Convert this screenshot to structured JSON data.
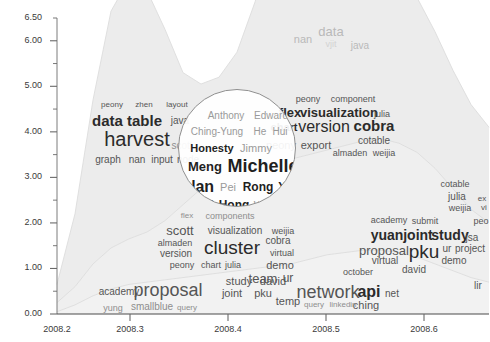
{
  "chart_data": {
    "type": "area",
    "title": "",
    "xlabel": "",
    "ylabel": "",
    "xlim": [
      2008.2,
      2008.65
    ],
    "ylim": [
      0.0,
      6.5
    ],
    "grid": false,
    "legend": "none",
    "x_ticks": [
      "2008.2",
      "2008.3",
      "2008.4",
      "2008.5",
      "2008.6"
    ],
    "y_ticks": [
      "0.00",
      "1.00",
      "2.00",
      "3.00",
      "4.00",
      "5.00",
      "6.00",
      "6.50"
    ],
    "y_minor_step": 0.5,
    "series": [
      {
        "name": "topic-upper-stream",
        "color": "#ececec",
        "values": [
          0.4,
          1.6,
          3.6,
          5.2,
          5.7,
          5.3,
          4.2,
          2.9,
          2.3,
          2.2,
          2.6,
          3.6,
          4.8,
          5.8,
          6.15,
          5.9,
          5.2,
          4.5,
          4.0,
          3.7,
          3.4,
          3.0,
          2.6,
          2.3,
          2.1
        ]
      },
      {
        "name": "topic-middle-stream",
        "color": "#efefef",
        "values": [
          0.2,
          0.4,
          0.7,
          0.9,
          1.0,
          1.1,
          1.3,
          1.6,
          1.9,
          2.1,
          2.2,
          2.25,
          2.3,
          2.3,
          2.3,
          2.3,
          2.35,
          2.4,
          2.45,
          2.4,
          2.3,
          2.1,
          1.8,
          1.5,
          1.3
        ]
      },
      {
        "name": "topic-lower-stream",
        "color": "#f2f2f2",
        "values": [
          0.05,
          0.2,
          0.4,
          0.55,
          0.65,
          0.7,
          0.75,
          0.8,
          0.85,
          0.9,
          0.95,
          1.0,
          1.05,
          1.1,
          1.2,
          1.3,
          1.35,
          1.4,
          1.4,
          1.35,
          1.25,
          1.1,
          0.95,
          0.8,
          0.7
        ]
      }
    ]
  },
  "axis": {
    "y_labels": [
      "6.50",
      "6.00",
      "5.00",
      "4.00",
      "3.00",
      "2.00",
      "1.00",
      "0.00"
    ],
    "x_labels": [
      "2008.2",
      "2008.3",
      "2008.4",
      "2008.5",
      "2008.6"
    ]
  },
  "cloud": {
    "left_peak": [
      {
        "t": "peony",
        "x": 112,
        "y": 105,
        "s": 8,
        "c": "g4",
        "b": false
      },
      {
        "t": "zhen",
        "x": 144,
        "y": 105,
        "s": 8,
        "c": "g4",
        "b": false
      },
      {
        "t": "layout",
        "x": 177,
        "y": 105,
        "s": 8,
        "c": "g4",
        "b": false
      },
      {
        "t": "data table",
        "x": 127,
        "y": 120,
        "s": 15,
        "c": "",
        "b": true
      },
      {
        "t": "java",
        "x": 180,
        "y": 121,
        "s": 10,
        "c": "g4",
        "b": false
      },
      {
        "t": "harvest",
        "x": 137,
        "y": 139,
        "s": 20,
        "c": "",
        "b": false
      },
      {
        "t": "scott",
        "x": 182,
        "y": 146,
        "s": 10,
        "c": "g1",
        "b": false
      },
      {
        "t": "graph",
        "x": 108,
        "y": 160,
        "s": 10,
        "c": "g4",
        "b": false
      },
      {
        "t": "nan",
        "x": 137,
        "y": 160,
        "s": 10,
        "c": "g4",
        "b": false
      },
      {
        "t": "input",
        "x": 162,
        "y": 160,
        "s": 10,
        "c": "g4",
        "b": false
      },
      {
        "t": "node",
        "x": 188,
        "y": 160,
        "s": 10,
        "c": "g4",
        "b": false
      }
    ],
    "right_peak_top": [
      {
        "t": "nan",
        "x": 303,
        "y": 39,
        "s": 11,
        "c": "g2",
        "b": false
      },
      {
        "t": "data",
        "x": 331,
        "y": 31,
        "s": 13,
        "c": "g2",
        "b": false
      },
      {
        "t": "vjit",
        "x": 331,
        "y": 44,
        "s": 9,
        "c": "g3",
        "b": false
      },
      {
        "t": "java",
        "x": 360,
        "y": 46,
        "s": 10,
        "c": "g2",
        "b": false
      }
    ],
    "right_peak": [
      {
        "t": "peony",
        "x": 308,
        "y": 99,
        "s": 9,
        "c": "g4",
        "b": false
      },
      {
        "t": "component",
        "x": 353,
        "y": 99,
        "s": 9,
        "c": "g4",
        "b": false
      },
      {
        "t": "flex",
        "x": 290,
        "y": 112,
        "s": 13,
        "c": "",
        "b": true
      },
      {
        "t": "visualization",
        "x": 339,
        "y": 112,
        "s": 13,
        "c": "",
        "b": true
      },
      {
        "t": "julia",
        "x": 382,
        "y": 114,
        "s": 9,
        "c": "g4",
        "b": false
      },
      {
        "t": "chart",
        "x": 284,
        "y": 127,
        "s": 11,
        "c": "",
        "b": true
      },
      {
        "t": "version",
        "x": 324,
        "y": 127,
        "s": 16,
        "c": "",
        "b": false
      },
      {
        "t": "cobra",
        "x": 374,
        "y": 125,
        "s": 15,
        "c": "",
        "b": true
      },
      {
        "t": "cotable",
        "x": 374,
        "y": 141,
        "s": 10,
        "c": "g4",
        "b": false
      },
      {
        "t": "peony",
        "x": 281,
        "y": 145,
        "s": 11,
        "c": "g4",
        "b": false
      },
      {
        "t": "export",
        "x": 316,
        "y": 145,
        "s": 11,
        "c": "g4",
        "b": false
      },
      {
        "t": "almaden",
        "x": 350,
        "y": 153,
        "s": 9,
        "c": "g4",
        "b": false
      },
      {
        "t": "weijia",
        "x": 384,
        "y": 153,
        "s": 9,
        "c": "g4",
        "b": false
      }
    ],
    "middle_band": [
      {
        "t": "flex",
        "x": 187,
        "y": 216,
        "s": 8,
        "c": "g1",
        "b": false
      },
      {
        "t": "components",
        "x": 230,
        "y": 216,
        "s": 9,
        "c": "g1",
        "b": false
      },
      {
        "t": "scott",
        "x": 180,
        "y": 230,
        "s": 13,
        "c": "g4",
        "b": false
      },
      {
        "t": "visualization",
        "x": 235,
        "y": 231,
        "s": 10,
        "c": "g4",
        "b": false
      },
      {
        "t": "weijia",
        "x": 283,
        "y": 231,
        "s": 9,
        "c": "g4",
        "b": false
      },
      {
        "t": "almaden",
        "x": 175,
        "y": 243,
        "s": 9,
        "c": "g4",
        "b": false
      },
      {
        "t": "cluster",
        "x": 232,
        "y": 247,
        "s": 19,
        "c": "",
        "b": false
      },
      {
        "t": "cobra",
        "x": 278,
        "y": 241,
        "s": 10,
        "c": "g4",
        "b": false
      },
      {
        "t": "version",
        "x": 176,
        "y": 254,
        "s": 10,
        "c": "g4",
        "b": false
      },
      {
        "t": "virtual",
        "x": 282,
        "y": 253,
        "s": 9,
        "c": "g4",
        "b": false
      },
      {
        "t": "peony",
        "x": 182,
        "y": 265,
        "s": 9,
        "c": "g4",
        "b": false
      },
      {
        "t": "chart",
        "x": 211,
        "y": 265,
        "s": 9,
        "c": "g4",
        "b": false
      },
      {
        "t": "julia",
        "x": 233,
        "y": 265,
        "s": 9,
        "c": "g4",
        "b": false
      },
      {
        "t": "demo",
        "x": 280,
        "y": 265,
        "s": 11,
        "c": "g4",
        "b": false
      },
      {
        "t": "team",
        "x": 263,
        "y": 278,
        "s": 13,
        "c": "g4",
        "b": false
      },
      {
        "t": "ur",
        "x": 288,
        "y": 278,
        "s": 12,
        "c": "g4",
        "b": false
      }
    ],
    "right_lower": [
      {
        "t": "academy",
        "x": 389,
        "y": 220,
        "s": 9,
        "c": "g4",
        "b": false
      },
      {
        "t": "submit",
        "x": 425,
        "y": 221,
        "s": 9,
        "c": "g4",
        "b": false
      },
      {
        "t": "yuan",
        "x": 387,
        "y": 235,
        "s": 14,
        "c": "",
        "b": true
      },
      {
        "t": "joint",
        "x": 418,
        "y": 235,
        "s": 14,
        "c": "",
        "b": true
      },
      {
        "t": "study",
        "x": 450,
        "y": 235,
        "s": 14,
        "c": "",
        "b": true
      },
      {
        "t": "jsa",
        "x": 472,
        "y": 238,
        "s": 10,
        "c": "g4",
        "b": false
      },
      {
        "t": "proposal",
        "x": 384,
        "y": 250,
        "s": 13,
        "c": "g4",
        "b": false
      },
      {
        "t": "pku",
        "x": 424,
        "y": 251,
        "s": 19,
        "c": "",
        "b": false
      },
      {
        "t": "ur",
        "x": 447,
        "y": 249,
        "s": 10,
        "c": "g4",
        "b": false
      },
      {
        "t": "project",
        "x": 470,
        "y": 249,
        "s": 10,
        "c": "g4",
        "b": false
      },
      {
        "t": "virtual",
        "x": 385,
        "y": 261,
        "s": 10,
        "c": "g4",
        "b": false
      },
      {
        "t": "demo",
        "x": 454,
        "y": 261,
        "s": 10,
        "c": "g4",
        "b": false
      },
      {
        "t": "october",
        "x": 358,
        "y": 272,
        "s": 9,
        "c": "g4",
        "b": false
      },
      {
        "t": "david",
        "x": 414,
        "y": 270,
        "s": 10,
        "c": "g4",
        "b": false
      }
    ],
    "right_edge": [
      {
        "t": "cotable",
        "x": 455,
        "y": 184,
        "s": 9,
        "c": "g4",
        "b": false
      },
      {
        "t": "julia",
        "x": 457,
        "y": 197,
        "s": 10,
        "c": "g4",
        "b": false
      },
      {
        "t": "ex",
        "x": 482,
        "y": 199,
        "s": 8,
        "c": "g4",
        "b": false
      },
      {
        "t": "weijia",
        "x": 460,
        "y": 208,
        "s": 9,
        "c": "g4",
        "b": false
      },
      {
        "t": "vi",
        "x": 484,
        "y": 208,
        "s": 8,
        "c": "g4",
        "b": false
      },
      {
        "t": "peo",
        "x": 481,
        "y": 221,
        "s": 9,
        "c": "g4",
        "b": false
      },
      {
        "t": "lir",
        "x": 478,
        "y": 286,
        "s": 10,
        "c": "g4",
        "b": false
      }
    ],
    "bottom_band": [
      {
        "t": "study",
        "x": 239,
        "y": 281,
        "s": 11,
        "c": "g4",
        "b": false
      },
      {
        "t": "david",
        "x": 273,
        "y": 281,
        "s": 11,
        "c": "g4",
        "b": false
      },
      {
        "t": "proposal",
        "x": 168,
        "y": 290,
        "s": 18,
        "c": "g4",
        "b": false
      },
      {
        "t": "academy",
        "x": 119,
        "y": 292,
        "s": 10,
        "c": "g4",
        "b": false
      },
      {
        "t": "joint",
        "x": 232,
        "y": 293,
        "s": 11,
        "c": "g4",
        "b": false
      },
      {
        "t": "pku",
        "x": 263,
        "y": 293,
        "s": 11,
        "c": "g4",
        "b": false
      },
      {
        "t": "temp",
        "x": 288,
        "y": 301,
        "s": 11,
        "c": "g4",
        "b": false
      },
      {
        "t": "network",
        "x": 328,
        "y": 292,
        "s": 18,
        "c": "g4",
        "b": false
      },
      {
        "t": "api",
        "x": 369,
        "y": 292,
        "s": 16,
        "c": "",
        "b": true
      },
      {
        "t": "net",
        "x": 392,
        "y": 294,
        "s": 10,
        "c": "g4",
        "b": false
      },
      {
        "t": "ching",
        "x": 366,
        "y": 305,
        "s": 11,
        "c": "g4",
        "b": false
      },
      {
        "t": "yung",
        "x": 113,
        "y": 308,
        "s": 9,
        "c": "g1",
        "b": false
      },
      {
        "t": "smallblue",
        "x": 152,
        "y": 307,
        "s": 10,
        "c": "g1",
        "b": false
      },
      {
        "t": "query",
        "x": 187,
        "y": 308,
        "s": 8,
        "c": "g1",
        "b": false
      },
      {
        "t": "query",
        "x": 314,
        "y": 305,
        "s": 8,
        "c": "g1",
        "b": false
      },
      {
        "t": "linkedin",
        "x": 343,
        "y": 305,
        "s": 8,
        "c": "g1",
        "b": false
      }
    ]
  },
  "lens": {
    "center_x": 237,
    "center_y": 148,
    "radius": 59,
    "border_color": "#8f8f8f",
    "words": [
      {
        "t": "Anthony",
        "x": 47,
        "y": 26,
        "s": 10,
        "c": "g",
        "b": false
      },
      {
        "t": "Edward",
        "x": 92,
        "y": 26,
        "s": 10,
        "c": "g",
        "b": false
      },
      {
        "t": "Ching-Yung",
        "x": 38,
        "y": 42,
        "s": 10,
        "c": "g",
        "b": false
      },
      {
        "t": "He",
        "x": 81,
        "y": 42,
        "s": 10,
        "c": "g",
        "b": false
      },
      {
        "t": "Hui",
        "x": 101,
        "y": 42,
        "s": 10,
        "c": "g",
        "b": false
      },
      {
        "t": "Honesty",
        "x": 33,
        "y": 58,
        "s": 11,
        "c": "",
        "b": true
      },
      {
        "t": "Jimmy",
        "x": 77,
        "y": 58,
        "s": 11,
        "c": "g",
        "b": false
      },
      {
        "t": "Meng",
        "x": 26,
        "y": 76,
        "s": 13,
        "c": "",
        "b": true
      },
      {
        "t": "Michelle",
        "x": 84,
        "y": 76,
        "s": 18,
        "c": "",
        "b": true
      },
      {
        "t": "Nan",
        "x": 20,
        "y": 97,
        "s": 16,
        "c": "",
        "b": true
      },
      {
        "t": "Pei",
        "x": 49,
        "y": 97,
        "s": 11,
        "c": "g",
        "b": false
      },
      {
        "t": "Rong",
        "x": 79,
        "y": 97,
        "s": 12,
        "c": "",
        "b": true
      },
      {
        "t": "Yao",
        "x": 110,
        "y": 97,
        "s": 12,
        "c": "",
        "b": true
      },
      {
        "t": "Wei",
        "x": 24,
        "y": 115,
        "s": 12,
        "c": "",
        "b": true
      },
      {
        "t": "Hong",
        "x": 55,
        "y": 115,
        "s": 12,
        "c": "",
        "b": true
      },
      {
        "t": "Wei",
        "x": 84,
        "y": 115,
        "s": 11,
        "c": "g",
        "b": false
      },
      {
        "t": "Jia",
        "x": 106,
        "y": 115,
        "s": 11,
        "c": "g",
        "b": false
      }
    ]
  }
}
